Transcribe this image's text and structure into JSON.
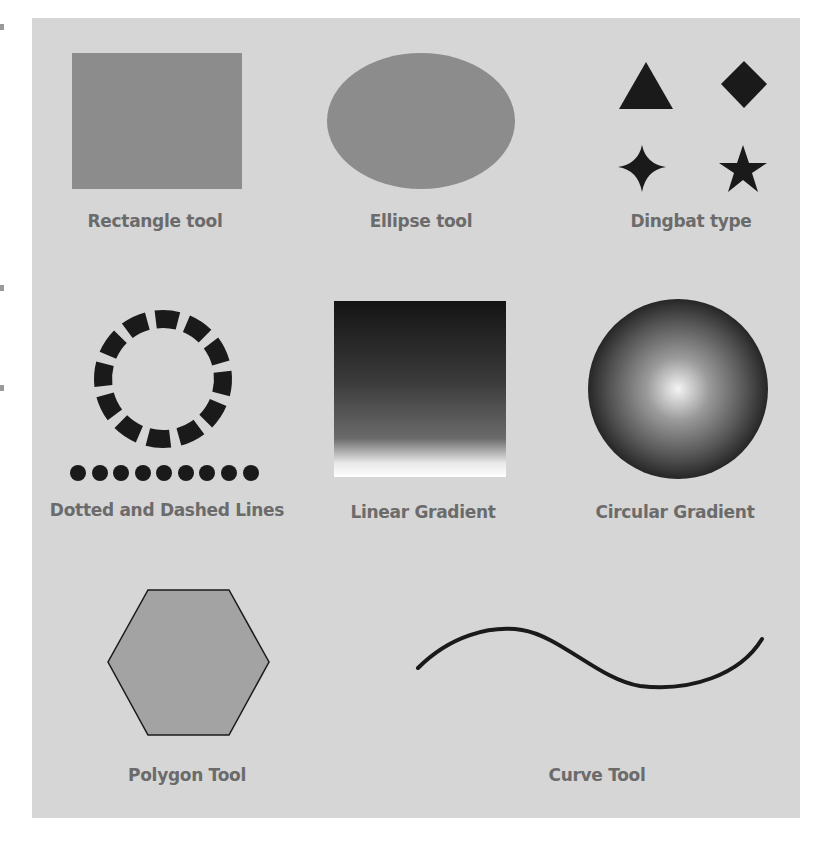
{
  "labels": {
    "rectangle": "Rectangle tool",
    "ellipse": "Ellipse tool",
    "dingbat": "Dingbat type",
    "dotted_dashed": "Dotted and Dashed Lines",
    "linear_gradient": "Linear Gradient",
    "circular_gradient": "Circular Gradient",
    "polygon": "Polygon Tool",
    "curve": "Curve Tool"
  },
  "dingbats": [
    "triangle",
    "diamond",
    "four-point-star",
    "five-point-star"
  ],
  "dashed_circle": {
    "dash_count": 12
  },
  "dotted_line": {
    "dot_count": 9
  },
  "colors": {
    "panel": "#d6d6d6",
    "shape_fill": "#8c8c8c",
    "ink": "#1a1a1a",
    "label": "#6b6b6b"
  }
}
